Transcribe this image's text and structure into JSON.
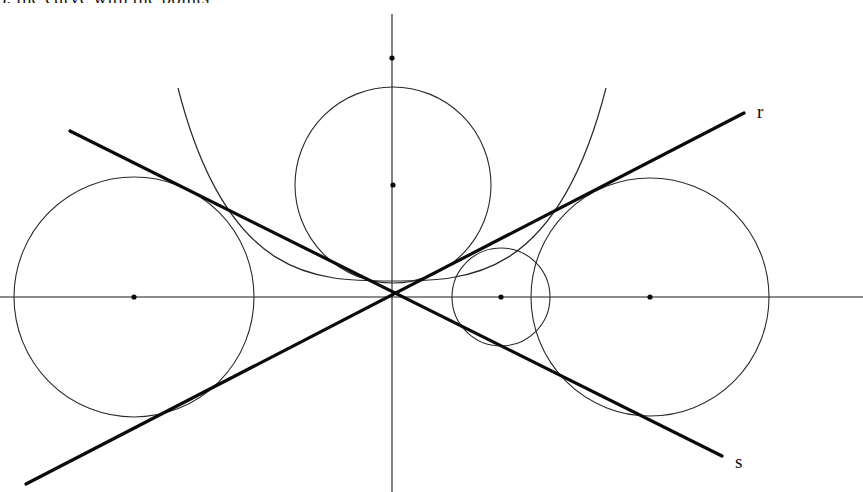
{
  "figure": {
    "width": 863,
    "height": 492,
    "background_color": "#ffffff",
    "stroke_color": "#2a2a2a",
    "bold_stroke_color": "#0a0a0a",
    "partial_caption": "), the curve with the points",
    "labels": {
      "line_r": "r",
      "line_s": "s"
    }
  },
  "chart_data": {
    "type": "scatter",
    "xlabel": "",
    "ylabel": "",
    "xlim": [
      0,
      863
    ],
    "ylim": [
      0,
      492
    ],
    "grid": false,
    "legend": "none",
    "origin": {
      "x": 392,
      "y": 297
    },
    "axes": [
      {
        "name": "x-axis",
        "x1": 0,
        "y1": 297,
        "x2": 863,
        "y2": 297
      },
      {
        "name": "y-axis",
        "x1": 392,
        "y1": 14,
        "x2": 392,
        "y2": 492
      }
    ],
    "lines": [
      {
        "name": "line-r",
        "label": "r",
        "x1": 26,
        "y1": 484,
        "x2": 744,
        "y2": 113,
        "label_x": 757,
        "label_y": 118
      },
      {
        "name": "line-s",
        "label": "s",
        "x1": 70,
        "y1": 131,
        "x2": 722,
        "y2": 456,
        "label_x": 735,
        "label_y": 468
      }
    ],
    "circles": [
      {
        "name": "left-circle",
        "cx": 134,
        "cy": 297,
        "r": 120,
        "center_dot": true
      },
      {
        "name": "top-circle",
        "cx": 393,
        "cy": 185,
        "r": 98,
        "center_dot": true
      },
      {
        "name": "small-circle",
        "cx": 501,
        "cy": 297,
        "r": 49,
        "center_dot": true
      },
      {
        "name": "right-circle",
        "cx": 650,
        "cy": 297,
        "r": 119,
        "center_dot": true
      }
    ],
    "arcs": [
      {
        "name": "large-tangent-arc",
        "description": "wide upward-opening arc tangent to both lines near the origin",
        "left_x": 178,
        "left_y": 88,
        "vertex_x": 392,
        "vertex_y": 281,
        "right_x": 606,
        "right_y": 88
      }
    ],
    "points": [
      {
        "name": "origin-point",
        "x": 392,
        "y": 297,
        "marker": "none"
      },
      {
        "name": "y-axis-upper-point",
        "x": 392,
        "y": 58,
        "marker": "dot"
      },
      {
        "name": "top-circle-center",
        "x": 393,
        "y": 185,
        "marker": "dot"
      },
      {
        "name": "left-circle-center",
        "x": 134,
        "y": 297,
        "marker": "dot"
      },
      {
        "name": "small-circle-center",
        "x": 501,
        "y": 297,
        "marker": "dot"
      },
      {
        "name": "right-circle-center",
        "x": 650,
        "y": 297,
        "marker": "dot"
      }
    ]
  }
}
